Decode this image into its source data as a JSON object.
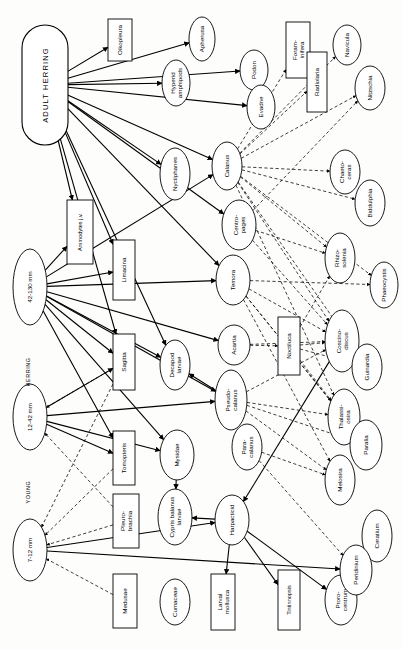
{
  "figure": {
    "orientation": "rotated-90",
    "background": "#fdfdfc",
    "line_color": "#000000",
    "solid_meaning": "direct feeding link",
    "dashed_meaning": "secondary / inferred feeding link"
  },
  "group_labels": [
    {
      "id": "g-herring",
      "text": "HERRING"
    },
    {
      "id": "g-young",
      "text": "YOUNG"
    }
  ],
  "nodes": [
    {
      "id": "adult-herring",
      "label": "ADULT HERRING",
      "shape": "stadium",
      "cx": 45,
      "cy": 85,
      "rx": 23,
      "ry": 60
    },
    {
      "id": "herring-42-130",
      "label": "42-130 mm",
      "shape": "ellipse",
      "cx": 30,
      "cy": 287,
      "rx": 17,
      "ry": 38
    },
    {
      "id": "herring-12-42",
      "label": "12-42 mm",
      "shape": "ellipse",
      "cx": 30,
      "cy": 417,
      "rx": 17,
      "ry": 33
    },
    {
      "id": "herring-7-12",
      "label": "7-12 mm",
      "shape": "ellipse",
      "cx": 30,
      "cy": 550,
      "rx": 17,
      "ry": 31
    },
    {
      "id": "oikopleura",
      "label": "Oikopleura",
      "shape": "rect",
      "cx": 120,
      "cy": 40,
      "rx": 12,
      "ry": 21
    },
    {
      "id": "apherusa",
      "label": "Apherusa",
      "shape": "ellipse",
      "cx": 202,
      "cy": 39,
      "rx": 13,
      "ry": 22
    },
    {
      "id": "hyperid-amphipods",
      "label": "Hyperid amphipods",
      "shape": "ellipse",
      "cx": 176,
      "cy": 83,
      "rx": 14,
      "ry": 23
    },
    {
      "id": "podon",
      "label": "Podon",
      "shape": "ellipse",
      "cx": 254,
      "cy": 70,
      "rx": 14,
      "ry": 20
    },
    {
      "id": "evadne",
      "label": "Evadne",
      "shape": "ellipse",
      "cx": 261,
      "cy": 107,
      "rx": 14,
      "ry": 22
    },
    {
      "id": "foraminifera",
      "label": "Foram-inifera",
      "shape": "rect",
      "cx": 298,
      "cy": 50,
      "rx": 12,
      "ry": 28
    },
    {
      "id": "radiolaria",
      "label": "Radiolaria",
      "shape": "rect",
      "cx": 317,
      "cy": 82,
      "rx": 10,
      "ry": 30
    },
    {
      "id": "navicula",
      "label": "Navicula",
      "shape": "ellipse",
      "cx": 347,
      "cy": 45,
      "rx": 14,
      "ry": 20
    },
    {
      "id": "nitzschia",
      "label": "Nitzschia",
      "shape": "ellipse",
      "cx": 370,
      "cy": 88,
      "rx": 15,
      "ry": 22
    },
    {
      "id": "nyctiphanes",
      "label": "Nyctiphanes",
      "shape": "ellipse",
      "cx": 175,
      "cy": 174,
      "rx": 15,
      "ry": 26
    },
    {
      "id": "calanus",
      "label": "Calanus",
      "shape": "ellipse",
      "cx": 227,
      "cy": 166,
      "rx": 15,
      "ry": 24
    },
    {
      "id": "chaetoceras",
      "label": "Chaeto-ceras",
      "shape": "ellipse",
      "cx": 345,
      "cy": 172,
      "rx": 15,
      "ry": 22
    },
    {
      "id": "biddulphia",
      "label": "Biddulphia",
      "shape": "ellipse",
      "cx": 370,
      "cy": 203,
      "rx": 15,
      "ry": 23
    },
    {
      "id": "ammodytes",
      "label": "Ammodytes j.v.",
      "shape": "rect",
      "cx": 80,
      "cy": 232,
      "rx": 13,
      "ry": 32
    },
    {
      "id": "centropages",
      "label": "Centro-pages",
      "shape": "ellipse",
      "cx": 239,
      "cy": 225,
      "rx": 17,
      "ry": 25
    },
    {
      "id": "rhizosolenia",
      "label": "Rhizo-solenia",
      "shape": "ellipse",
      "cx": 340,
      "cy": 258,
      "rx": 15,
      "ry": 25
    },
    {
      "id": "limacina",
      "label": "Limacina",
      "shape": "rect",
      "cx": 124,
      "cy": 270,
      "rx": 11,
      "ry": 30
    },
    {
      "id": "temora",
      "label": "Temora",
      "shape": "ellipse",
      "cx": 233,
      "cy": 280,
      "rx": 17,
      "ry": 25
    },
    {
      "id": "phaeocystis",
      "label": "Phaeocystis",
      "shape": "ellipse",
      "cx": 384,
      "cy": 285,
      "rx": 14,
      "ry": 23
    },
    {
      "id": "acartia",
      "label": "Acartia",
      "shape": "ellipse",
      "cx": 234,
      "cy": 345,
      "rx": 16,
      "ry": 20
    },
    {
      "id": "noctiluca",
      "label": "Noctiluca",
      "shape": "rect",
      "cx": 289,
      "cy": 346,
      "rx": 11,
      "ry": 29
    },
    {
      "id": "coscinodiscus",
      "label": "Coscino-discus",
      "shape": "ellipse",
      "cx": 342,
      "cy": 341,
      "rx": 17,
      "ry": 31
    },
    {
      "id": "sagitta",
      "label": "Sagitta",
      "shape": "rect",
      "cx": 124,
      "cy": 362,
      "rx": 11,
      "ry": 28
    },
    {
      "id": "decapod-larvae",
      "label": "Decapod larvae",
      "shape": "ellipse",
      "cx": 175,
      "cy": 365,
      "rx": 15,
      "ry": 25
    },
    {
      "id": "guinardia",
      "label": "Guinardia",
      "shape": "ellipse",
      "cx": 367,
      "cy": 367,
      "rx": 15,
      "ry": 23
    },
    {
      "id": "pseudocalanus",
      "label": "Pseudo-calanus",
      "shape": "ellipse",
      "cx": 231,
      "cy": 400,
      "rx": 16,
      "ry": 30
    },
    {
      "id": "thalassiosira",
      "label": "Thalassi-osira",
      "shape": "ellipse",
      "cx": 344,
      "cy": 417,
      "rx": 16,
      "ry": 28
    },
    {
      "id": "tomopteris",
      "label": "Tomopteris",
      "shape": "rect",
      "cx": 124,
      "cy": 458,
      "rx": 11,
      "ry": 27
    },
    {
      "id": "mysidae",
      "label": "Mysidae",
      "shape": "ellipse",
      "cx": 177,
      "cy": 455,
      "rx": 17,
      "ry": 25
    },
    {
      "id": "paracalanus",
      "label": "Para-calanus",
      "shape": "ellipse",
      "cx": 247,
      "cy": 447,
      "rx": 15,
      "ry": 23
    },
    {
      "id": "paralia",
      "label": "Paralia",
      "shape": "ellipse",
      "cx": 366,
      "cy": 445,
      "rx": 16,
      "ry": 25
    },
    {
      "id": "melosira",
      "label": "Melosira",
      "shape": "ellipse",
      "cx": 340,
      "cy": 480,
      "rx": 15,
      "ry": 25
    },
    {
      "id": "pleurobrachia",
      "label": "Pleuro-brachia",
      "shape": "rect",
      "cx": 126,
      "cy": 521,
      "rx": 13,
      "ry": 27
    },
    {
      "id": "cypris-balanus-larvae",
      "label": "Cypris balanus larvae",
      "shape": "ellipse",
      "cx": 175,
      "cy": 517,
      "rx": 17,
      "ry": 28
    },
    {
      "id": "harpacticid",
      "label": "Harpacticid",
      "shape": "ellipse",
      "cx": 232,
      "cy": 520,
      "rx": 17,
      "ry": 25
    },
    {
      "id": "ceratium",
      "label": "Ceratium",
      "shape": "ellipse",
      "cx": 377,
      "cy": 536,
      "rx": 15,
      "ry": 26
    },
    {
      "id": "medusae",
      "label": "Medusae",
      "shape": "rect",
      "cx": 125,
      "cy": 601,
      "rx": 12,
      "ry": 27
    },
    {
      "id": "cumaceae",
      "label": "Cumaceae",
      "shape": "ellipse",
      "cx": 175,
      "cy": 602,
      "rx": 15,
      "ry": 23
    },
    {
      "id": "larval-mollusca",
      "label": "Larval mollusca",
      "shape": "rect",
      "cx": 223,
      "cy": 602,
      "rx": 12,
      "ry": 28
    },
    {
      "id": "tintinnopsis",
      "label": "Tintinnopsis",
      "shape": "rect",
      "cx": 289,
      "cy": 600,
      "rx": 11,
      "ry": 30
    },
    {
      "id": "prorocentrum",
      "label": "Proro-centrum",
      "shape": "ellipse",
      "cx": 341,
      "cy": 600,
      "rx": 16,
      "ry": 25
    },
    {
      "id": "peridinium",
      "label": "Peridinium",
      "shape": "ellipse",
      "cx": 356,
      "cy": 570,
      "rx": 16,
      "ry": 25
    }
  ],
  "links_solid": [
    [
      "adult-herring",
      "oikopleura"
    ],
    [
      "adult-herring",
      "apherusa"
    ],
    [
      "adult-herring",
      "hyperid-amphipods"
    ],
    [
      "adult-herring",
      "podon"
    ],
    [
      "adult-herring",
      "evadne"
    ],
    [
      "adult-herring",
      "nyctiphanes"
    ],
    [
      "adult-herring",
      "calanus"
    ],
    [
      "adult-herring",
      "centropages"
    ],
    [
      "adult-herring",
      "temora"
    ],
    [
      "adult-herring",
      "limacina"
    ],
    [
      "adult-herring",
      "sagitta"
    ],
    [
      "adult-herring",
      "ammodytes"
    ],
    [
      "adult-herring",
      "decapod-larvae"
    ],
    [
      "herring-42-130",
      "ammodytes"
    ],
    [
      "herring-42-130",
      "limacina"
    ],
    [
      "herring-42-130",
      "sagitta"
    ],
    [
      "herring-42-130",
      "decapod-larvae"
    ],
    [
      "herring-42-130",
      "temora"
    ],
    [
      "herring-42-130",
      "acartia"
    ],
    [
      "herring-42-130",
      "pseudocalanus"
    ],
    [
      "herring-42-130",
      "mysidae"
    ],
    [
      "herring-42-130",
      "tomopteris"
    ],
    [
      "herring-42-130",
      "calanus"
    ],
    [
      "herring-12-42",
      "pseudocalanus"
    ],
    [
      "herring-12-42",
      "mysidae"
    ],
    [
      "herring-12-42",
      "tomopteris"
    ],
    [
      "herring-12-42",
      "sagitta"
    ],
    [
      "herring-7-12",
      "harpacticid"
    ],
    [
      "herring-7-12",
      "peridinium"
    ],
    [
      "harpacticid",
      "larval-mollusca"
    ],
    [
      "harpacticid",
      "tintinnopsis"
    ],
    [
      "harpacticid",
      "prorocentrum"
    ],
    [
      "harpacticid",
      "cypris-balanus-larvae"
    ],
    [
      "mysidae",
      "cypris-balanus-larvae"
    ],
    [
      "pseudocalanus",
      "decapod-larvae"
    ],
    [
      "coscinodiscus",
      "harpacticid"
    ]
  ],
  "links_dashed": [
    [
      "calanus",
      "foraminifera"
    ],
    [
      "calanus",
      "radiolaria"
    ],
    [
      "calanus",
      "navicula"
    ],
    [
      "calanus",
      "nitzschia"
    ],
    [
      "calanus",
      "chaetoceras"
    ],
    [
      "calanus",
      "biddulphia"
    ],
    [
      "calanus",
      "rhizosolenia"
    ],
    [
      "calanus",
      "phaeocystis"
    ],
    [
      "calanus",
      "coscinodiscus"
    ],
    [
      "calanus",
      "guinardia"
    ],
    [
      "calanus",
      "thalassiosira"
    ],
    [
      "centropages",
      "nitzschia"
    ],
    [
      "centropages",
      "coscinodiscus"
    ],
    [
      "centropages",
      "rhizosolenia"
    ],
    [
      "temora",
      "coscinodiscus"
    ],
    [
      "temora",
      "phaeocystis"
    ],
    [
      "temora",
      "thalassiosira"
    ],
    [
      "temora",
      "paralia"
    ],
    [
      "temora",
      "melosira"
    ],
    [
      "acartia",
      "coscinodiscus"
    ],
    [
      "acartia",
      "noctiluca"
    ],
    [
      "pseudocalanus",
      "coscinodiscus"
    ],
    [
      "pseudocalanus",
      "thalassiosira"
    ],
    [
      "pseudocalanus",
      "melosira"
    ],
    [
      "pseudocalanus",
      "paralia"
    ],
    [
      "paracalanus",
      "melosira"
    ],
    [
      "paracalanus",
      "peridinium"
    ],
    [
      "noctiluca",
      "coscinodiscus"
    ],
    [
      "noctiluca",
      "rhizosolenia"
    ],
    [
      "noctiluca",
      "guinardia"
    ],
    [
      "noctiluca",
      "thalassiosira"
    ],
    [
      "medusae",
      "herring-7-12"
    ],
    [
      "pleurobrachia",
      "herring-7-12"
    ],
    [
      "pleurobrachia",
      "herring-12-42"
    ],
    [
      "tomopteris",
      "herring-7-12"
    ],
    [
      "sagitta",
      "herring-12-42"
    ],
    [
      "sagitta",
      "herring-7-12"
    ],
    [
      "ceratium",
      "peridinium"
    ],
    [
      "foraminifera",
      "radiolaria"
    ]
  ]
}
